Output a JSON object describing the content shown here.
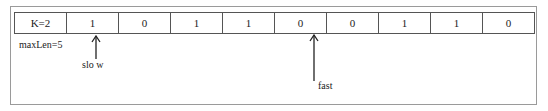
{
  "array": {
    "header": "K=2",
    "cells": [
      "1",
      "0",
      "1",
      "1",
      "0",
      "0",
      "1",
      "1",
      "0"
    ]
  },
  "annotations": {
    "max_len": "maxLen=5",
    "slow_label": "slo w",
    "fast_label": "fast"
  },
  "pointers": {
    "slow_index": 0,
    "fast_index": 4
  },
  "colors": {
    "frame": "#9a9a9a",
    "lines": "#555555",
    "text": "#222222"
  }
}
